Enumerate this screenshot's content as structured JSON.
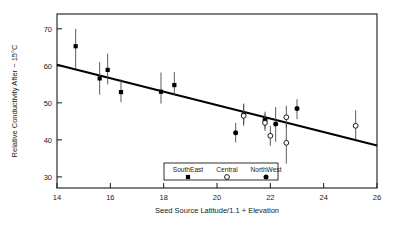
{
  "chart_data": {
    "type": "scatter",
    "title": "",
    "xlabel": "Seed Source Latitude/1.1 + Elevation",
    "ylabel": "Relative Conductivity After − 15°C",
    "xlim": [
      14,
      26
    ],
    "ylim": [
      27,
      74
    ],
    "xticks": [
      14,
      16,
      18,
      20,
      22,
      24,
      26
    ],
    "xtick_labels": [
      "14",
      "16",
      "18",
      "20",
      "22",
      "24",
      "26"
    ],
    "yticks": [
      30,
      40,
      50,
      60,
      70
    ],
    "ytick_labels": [
      "30",
      "40",
      "50",
      "60",
      "70"
    ],
    "grid": false,
    "legend_position": "bottom-center",
    "legend": [
      {
        "label": "SouthEast",
        "marker": "filled-square",
        "color": "#000000"
      },
      {
        "label": "Central",
        "marker": "open-circle",
        "color": "#000000"
      },
      {
        "label": "NorthWest",
        "marker": "filled-circle",
        "color": "#000000"
      }
    ],
    "series": [
      {
        "name": "SouthEast",
        "marker": "filled-square",
        "points": [
          {
            "x": 14.7,
            "y": 65.3,
            "ylow": 59.3,
            "yhigh": 70.0
          },
          {
            "x": 15.6,
            "y": 56.6,
            "ylow": 52.2,
            "yhigh": 61.0
          },
          {
            "x": 15.9,
            "y": 58.9,
            "ylow": 55.0,
            "yhigh": 63.3
          },
          {
            "x": 16.4,
            "y": 52.9,
            "ylow": 50.2,
            "yhigh": 56.3
          },
          {
            "x": 17.9,
            "y": 53.0,
            "ylow": 49.8,
            "yhigh": 58.2
          },
          {
            "x": 18.4,
            "y": 54.8,
            "ylow": 52.0,
            "yhigh": 58.3
          }
        ]
      },
      {
        "name": "NorthWest",
        "marker": "filled-circle",
        "points": [
          {
            "x": 20.7,
            "y": 41.9,
            "ylow": 39.3,
            "yhigh": 44.6
          },
          {
            "x": 21.0,
            "y": 46.8,
            "ylow": 44.2,
            "yhigh": 49.8
          },
          {
            "x": 21.8,
            "y": 45.4,
            "ylow": 43.0,
            "yhigh": 47.6
          },
          {
            "x": 22.2,
            "y": 44.3,
            "ylow": 39.5,
            "yhigh": 48.9
          },
          {
            "x": 23.0,
            "y": 48.5,
            "ylow": 45.6,
            "yhigh": 51.0
          }
        ]
      },
      {
        "name": "Central",
        "marker": "open-circle",
        "points": [
          {
            "x": 21.0,
            "y": 46.5,
            "ylow": 43.8,
            "yhigh": 49.6
          },
          {
            "x": 21.8,
            "y": 44.6,
            "ylow": 42.4,
            "yhigh": 47.0
          },
          {
            "x": 22.0,
            "y": 41.1,
            "ylow": 38.4,
            "yhigh": 43.8
          },
          {
            "x": 22.6,
            "y": 46.1,
            "ylow": 43.3,
            "yhigh": 49.2
          },
          {
            "x": 22.6,
            "y": 39.2,
            "ylow": 33.6,
            "yhigh": 44.3
          },
          {
            "x": 25.2,
            "y": 43.8,
            "ylow": 40.0,
            "yhigh": 48.0
          }
        ]
      }
    ],
    "fit_line": {
      "name": "regression-line",
      "x_start": 14.0,
      "y_start": 60.3,
      "x_end": 26.0,
      "y_end": 38.5
    }
  }
}
